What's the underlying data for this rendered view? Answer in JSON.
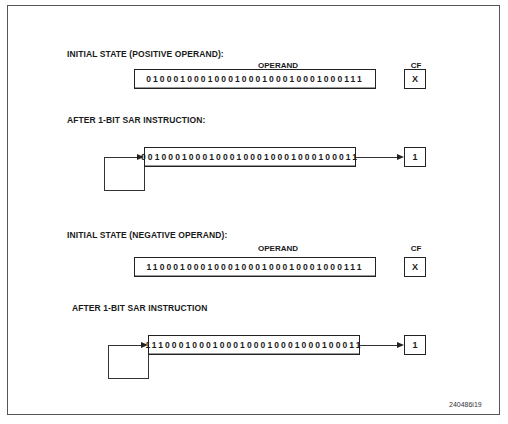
{
  "figure_id": "240486i19",
  "sections": [
    {
      "title": "INITIAL STATE (POSITIVE OPERAND):",
      "operand_header": "OPERAND",
      "cf_header": "CF",
      "operand_value": "01000100010001000100010001000111",
      "cf_value": "X"
    },
    {
      "title": "AFTER 1-BIT SAR INSTRUCTION:",
      "operand_value": "00100010001000100010001000100011",
      "cf_value": "1"
    },
    {
      "title": "INITIAL STATE (NEGATIVE OPERAND):",
      "operand_header": "OPERAND",
      "cf_header": "CF",
      "operand_value": "11000100010001000100010001000111",
      "cf_value": "X"
    },
    {
      "title": "AFTER 1-BIT SAR INSTRUCTION",
      "operand_value": "11100010001000100010001000100011",
      "cf_value": "1"
    }
  ]
}
